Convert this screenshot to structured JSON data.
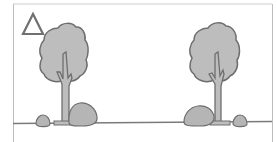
{
  "diagram": {
    "type": "illustration",
    "marker": {
      "shape": "triangle",
      "icon": "triangle-outline-icon"
    },
    "elements": [
      {
        "id": "tree-left",
        "kind": "tree",
        "rocks": [
          "small-rock-left",
          "large-rock-right"
        ]
      },
      {
        "id": "tree-right",
        "kind": "tree",
        "rocks": [
          "large-rock-left",
          "small-rock-right"
        ]
      }
    ],
    "colors": {
      "fill": "#bdbdbd",
      "stroke": "#707070",
      "frame": "#c8c8c8",
      "ground": "#7a7a7a",
      "background": "#ffffff"
    }
  }
}
